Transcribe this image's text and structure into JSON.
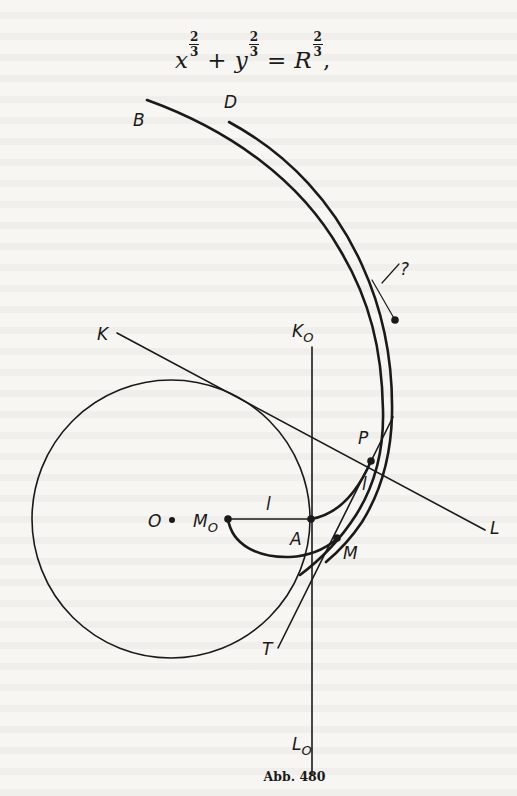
{
  "formula": {
    "terms": [
      {
        "base": "x",
        "exp_num": "2",
        "exp_den": "3"
      },
      {
        "base": "y",
        "exp_num": "2",
        "exp_den": "3"
      },
      {
        "base": "R",
        "exp_num": "2",
        "exp_den": "3"
      }
    ],
    "op_plus": "+",
    "op_equals": "=",
    "trailing": ","
  },
  "diagram": {
    "labels": {
      "B": "B",
      "D": "D",
      "question": "?",
      "K": "K",
      "K0_main": "K",
      "K0_sub": "O",
      "P": "P",
      "L": "L",
      "l_left": "l",
      "l_right": "l",
      "O": "O",
      "M0_main": "M",
      "M0_sub": "O",
      "A": "A",
      "M": "M",
      "T": "T",
      "L0_main": "L",
      "L0_sub": "O"
    }
  },
  "caption": "Abb. 480"
}
